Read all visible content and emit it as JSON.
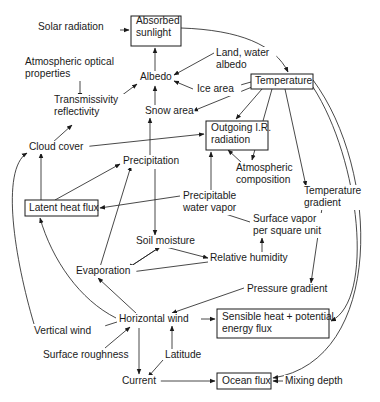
{
  "diagram": {
    "title": "",
    "nodes": [
      {
        "id": "solar_radiation",
        "lines": [
          "Solar radiation"
        ],
        "x": 38,
        "y": 30,
        "boxed": false
      },
      {
        "id": "absorbed_sunlight",
        "lines": [
          "Absorbed",
          "sunlight"
        ],
        "x": 136,
        "y": 24,
        "boxed": true,
        "bx": 131,
        "by": 16,
        "bw": 50,
        "bh": 30
      },
      {
        "id": "land_water_albedo",
        "lines": [
          "Land, water",
          "albedo"
        ],
        "x": 216,
        "y": 56,
        "boxed": false
      },
      {
        "id": "atmospheric_optical_properties",
        "lines": [
          "Atmospheric optical",
          "properties"
        ],
        "x": 25,
        "y": 65,
        "boxed": false
      },
      {
        "id": "albedo",
        "lines": [
          "Albedo"
        ],
        "x": 140,
        "y": 80,
        "boxed": false
      },
      {
        "id": "ice_area",
        "lines": [
          "Ice area"
        ],
        "x": 197,
        "y": 92,
        "boxed": false
      },
      {
        "id": "temperature",
        "lines": [
          "Temperature"
        ],
        "x": 255,
        "y": 84,
        "boxed": true,
        "bx": 251,
        "by": 74,
        "bw": 62,
        "bh": 15
      },
      {
        "id": "transmissivity_reflectivity",
        "lines": [
          "Transmissivity",
          "reflectivity"
        ],
        "x": 54,
        "y": 103,
        "boxed": false
      },
      {
        "id": "snow_area",
        "lines": [
          "Snow area"
        ],
        "x": 145,
        "y": 114,
        "boxed": false
      },
      {
        "id": "outgoing_ir",
        "lines": [
          "Outgoing I.R.",
          "radiation"
        ],
        "x": 211,
        "y": 131,
        "boxed": true,
        "bx": 206,
        "by": 121,
        "bw": 62,
        "bh": 29
      },
      {
        "id": "cloud_cover",
        "lines": [
          "Cloud cover"
        ],
        "x": 29,
        "y": 150,
        "boxed": false
      },
      {
        "id": "precipitation",
        "lines": [
          "Precipitation"
        ],
        "x": 123,
        "y": 164,
        "boxed": false
      },
      {
        "id": "atmospheric_composition",
        "lines": [
          "Atmospheric",
          "composition"
        ],
        "x": 236,
        "y": 171,
        "boxed": false
      },
      {
        "id": "temperature_gradient",
        "lines": [
          "Temperature",
          "gradient"
        ],
        "x": 304,
        "y": 194,
        "boxed": false
      },
      {
        "id": "latent_heat_flux",
        "lines": [
          "Latent heat flux"
        ],
        "x": 29,
        "y": 211,
        "boxed": true,
        "bx": 25,
        "by": 200,
        "bw": 73,
        "bh": 16
      },
      {
        "id": "precipitable_water_vapor",
        "lines": [
          "Precipitable",
          "water vapor"
        ],
        "x": 183,
        "y": 199,
        "boxed": false
      },
      {
        "id": "surface_vapor",
        "lines": [
          "Surface vapor",
          "per square unit"
        ],
        "x": 253,
        "y": 222,
        "boxed": false
      },
      {
        "id": "soil_moisture",
        "lines": [
          "Soil moisture"
        ],
        "x": 136,
        "y": 244,
        "boxed": false
      },
      {
        "id": "relative_humidity",
        "lines": [
          "Relative humidity"
        ],
        "x": 210,
        "y": 261,
        "boxed": false
      },
      {
        "id": "evaporation",
        "lines": [
          "Evaporation"
        ],
        "x": 76,
        "y": 274,
        "boxed": false
      },
      {
        "id": "pressure_gradient",
        "lines": [
          "Pressure gradient"
        ],
        "x": 247,
        "y": 292,
        "boxed": false
      },
      {
        "id": "horizontal_wind",
        "lines": [
          "Horizontal wind"
        ],
        "x": 119,
        "y": 322,
        "boxed": false
      },
      {
        "id": "sensible_heat",
        "lines": [
          "Sensible heat + potential",
          "energy flux"
        ],
        "x": 222,
        "y": 320,
        "boxed": true,
        "bx": 217,
        "by": 309,
        "bw": 112,
        "bh": 29
      },
      {
        "id": "vertical_wind",
        "lines": [
          "Vertical wind"
        ],
        "x": 34,
        "y": 334,
        "boxed": false
      },
      {
        "id": "surface_roughness",
        "lines": [
          "Surface roughness"
        ],
        "x": 43,
        "y": 358,
        "boxed": false
      },
      {
        "id": "latitude",
        "lines": [
          "Latitude"
        ],
        "x": 165,
        "y": 358,
        "boxed": false
      },
      {
        "id": "current",
        "lines": [
          "Current"
        ],
        "x": 122,
        "y": 384,
        "boxed": false
      },
      {
        "id": "ocean_flux",
        "lines": [
          "Ocean flux"
        ],
        "x": 222,
        "y": 384,
        "boxed": true,
        "bx": 217,
        "by": 373,
        "bw": 54,
        "bh": 16
      },
      {
        "id": "mixing_depth",
        "lines": [
          "Mixing depth"
        ],
        "x": 285,
        "y": 384,
        "boxed": false
      }
    ],
    "edges": [
      {
        "from": "solar_radiation",
        "to": "absorbed_sunlight",
        "d": "M102,30 L129,30"
      },
      {
        "from": "absorbed_sunlight",
        "to": "temperature",
        "d": "M181,28 C240,30 275,45 288,72"
      },
      {
        "from": "albedo",
        "to": "absorbed_sunlight",
        "d": "M155,75 L155,48"
      },
      {
        "from": "land_water_albedo",
        "to": "albedo",
        "d": "M214,53 L174,75"
      },
      {
        "from": "atmospheric_optical_properties",
        "to": "transmissivity_reflectivity",
        "d": "M80,79 L80,98"
      },
      {
        "from": "transmissivity_reflectivity",
        "to": "albedo",
        "d": "M117,99 L137,84"
      },
      {
        "from": "ice_area",
        "to": "albedo",
        "d": "M193,89 L174,81"
      },
      {
        "from": "temperature",
        "to": "ice_area",
        "d": "M251,82 L230,88"
      },
      {
        "from": "temperature",
        "to": "snow_area",
        "d": "M252,87 L193,111"
      },
      {
        "from": "temperature",
        "to": "outgoing_ir",
        "d": "M262,89 L236,119"
      },
      {
        "from": "snow_area",
        "to": "albedo",
        "d": "M155,107 L155,86"
      },
      {
        "from": "temperature",
        "to": "atmospheric_composition",
        "d": "M272,89 L252,160"
      },
      {
        "from": "temperature",
        "to": "temperature_gradient",
        "d": "M285,89 L306,186"
      },
      {
        "from": "temperature",
        "to": "sensible_heat",
        "d": "M313,87 C360,160 375,300 331,321"
      },
      {
        "from": "temperature",
        "to": "ocean_flux",
        "d": "M313,80 C380,170 385,360 273,378"
      },
      {
        "from": "transmissivity_reflectivity",
        "to": "cloud_cover_link",
        "d": "M52,143 L72,125"
      },
      {
        "from": "cloud_cover",
        "to": "outgoing_ir",
        "d": "M82,147 L204,134"
      },
      {
        "from": "precipitation",
        "to": "snow_area",
        "d": "M150,158 L150,118"
      },
      {
        "from": "atmospheric_composition",
        "to": "outgoing_ir",
        "d": "M242,163 L228,150"
      },
      {
        "from": "precipitable_water_vapor",
        "to": "outgoing_ir",
        "d": "M211,191 L211,152"
      },
      {
        "from": "latent_heat_flux",
        "to": "cloud_cover",
        "d": "M41,200 L41,153"
      },
      {
        "from": "latent_heat_flux",
        "to": "precipitation",
        "d": "M55,200 L120,164"
      },
      {
        "from": "precipitable_water_vapor",
        "to": "latent_heat_flux",
        "d": "M180,196 L100,208"
      },
      {
        "from": "precipitation",
        "to": "soil_moisture",
        "d": "M155,169 L155,235"
      },
      {
        "from": "surface_vapor",
        "to": "precipitable_water_vapor",
        "d": "M250,222 L207,208"
      },
      {
        "from": "relative_humidity",
        "to": "surface_vapor",
        "d": "M262,256 L262,238"
      },
      {
        "from": "soil_moisture",
        "to": "relative_humidity",
        "d": "M162,246 L208,258"
      },
      {
        "from": "soil_moisture",
        "to": "evaporation",
        "d": "M160,247 L128,268"
      },
      {
        "from": "relative_humidity",
        "to": "evaporation",
        "d": "M208,262 L131,272"
      },
      {
        "from": "evaporation",
        "to": "soil_moisture",
        "d": "M128,268 L160,247"
      },
      {
        "from": "evaporation",
        "to": "precipitation",
        "d": "M100,267 L131,166"
      },
      {
        "from": "temperature_gradient",
        "to": "pressure_gradient",
        "d": "M322,208 L311,283"
      },
      {
        "from": "pressure_gradient",
        "to": "horizontal_wind",
        "d": "M244,288 L172,313"
      },
      {
        "from": "horizontal_wind",
        "to": "latent_heat_flux",
        "d": "M116,318 C80,300 52,260 40,218"
      },
      {
        "from": "horizontal_wind",
        "to": "evaporation",
        "d": "M137,314 L98,278"
      },
      {
        "from": "horizontal_wind",
        "to": "vertical_wind",
        "d": "M117,322 L92,330"
      },
      {
        "from": "vertical_wind",
        "to": "cloud_cover",
        "d": "M34,324 C15,260 0,170 27,153"
      },
      {
        "from": "surface_roughness",
        "to": "horizontal_wind",
        "d": "M105,348 L130,327"
      },
      {
        "from": "horizontal_wind",
        "to": "sensible_heat",
        "d": "M195,319 L215,319"
      },
      {
        "from": "latitude",
        "to": "horizontal_wind",
        "d": "M172,350 L172,326"
      },
      {
        "from": "horizontal_wind",
        "to": "current",
        "d": "M139,328 L139,374"
      },
      {
        "from": "latitude",
        "to": "current",
        "d": "M163,360 L148,377"
      },
      {
        "from": "current",
        "to": "ocean_flux",
        "d": "M157,381 L215,381"
      },
      {
        "from": "mixing_depth",
        "to": "ocean_flux",
        "d": "M283,381 L273,381"
      }
    ]
  }
}
